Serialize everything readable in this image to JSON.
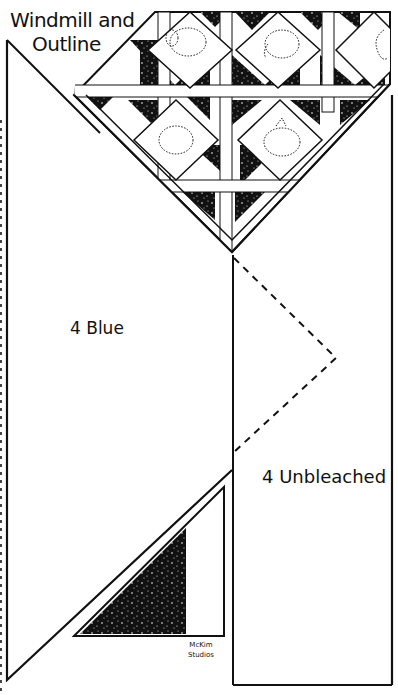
{
  "title": {
    "line1": "Windmill and",
    "line2": "Outline"
  },
  "pieces": {
    "blue": {
      "count": "4",
      "label": "4 Blue"
    },
    "unbleached": {
      "count": "4",
      "label": "4 Unbleached"
    }
  },
  "credit": {
    "line1": "McKim",
    "line2": "Studios"
  },
  "motifs": [
    "elephant-outline",
    "elephant-outline",
    "elephant-outline",
    "elephant-outline",
    "elephant-outline"
  ],
  "colors": {
    "ink": "#111111",
    "paper": "#ffffff"
  }
}
